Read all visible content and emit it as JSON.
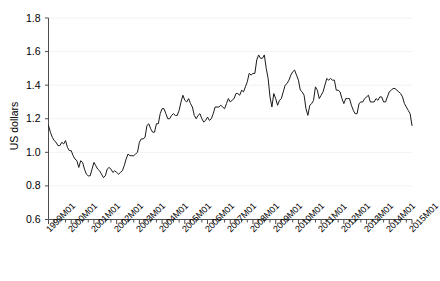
{
  "chart_data": {
    "type": "line",
    "title": "",
    "xlabel": "",
    "ylabel": "US dollars",
    "ylim": [
      0.6,
      1.8
    ],
    "ytick_values": [
      0.6,
      0.8,
      1.0,
      1.2,
      1.4,
      1.6,
      1.8
    ],
    "ytick_labels": [
      "0.6",
      "0.8",
      "1.0",
      "1.2",
      "1.4",
      "1.6",
      "1.8"
    ],
    "grid": true,
    "legend": "none",
    "xtick_labels": [
      "1999M01",
      "2000M01",
      "2001M01",
      "2002M01",
      "2003M01",
      "2004M01",
      "2005M01",
      "2006M01",
      "2007M01",
      "2008M01",
      "2009M01",
      "2010M01",
      "2011M01",
      "2012M01",
      "2013M01",
      "2014M01",
      "2015M01"
    ],
    "x_start": "1999M01",
    "x_end": "2015M01",
    "x_frequency": "monthly",
    "series": [
      {
        "name": "US dollars per euro",
        "color": "#1a1a1a",
        "values": [
          1.16,
          1.12,
          1.09,
          1.07,
          1.06,
          1.04,
          1.04,
          1.06,
          1.05,
          1.07,
          1.03,
          1.01,
          1.01,
          0.98,
          0.96,
          0.95,
          0.91,
          0.95,
          0.94,
          0.9,
          0.87,
          0.86,
          0.86,
          0.9,
          0.94,
          0.92,
          0.9,
          0.89,
          0.87,
          0.85,
          0.86,
          0.9,
          0.91,
          0.9,
          0.88,
          0.89,
          0.88,
          0.87,
          0.88,
          0.89,
          0.92,
          0.96,
          0.99,
          0.98,
          0.98,
          0.98,
          0.99,
          1.0,
          1.06,
          1.08,
          1.08,
          1.09,
          1.16,
          1.17,
          1.14,
          1.12,
          1.12,
          1.17,
          1.17,
          1.23,
          1.26,
          1.26,
          1.23,
          1.2,
          1.2,
          1.22,
          1.23,
          1.22,
          1.22,
          1.25,
          1.3,
          1.34,
          1.31,
          1.3,
          1.32,
          1.29,
          1.27,
          1.22,
          1.2,
          1.22,
          1.23,
          1.2,
          1.18,
          1.19,
          1.21,
          1.19,
          1.2,
          1.23,
          1.27,
          1.27,
          1.27,
          1.28,
          1.27,
          1.26,
          1.29,
          1.32,
          1.3,
          1.31,
          1.32,
          1.35,
          1.35,
          1.34,
          1.37,
          1.36,
          1.39,
          1.42,
          1.47,
          1.46,
          1.47,
          1.47,
          1.55,
          1.58,
          1.56,
          1.56,
          1.58,
          1.5,
          1.44,
          1.33,
          1.27,
          1.35,
          1.32,
          1.28,
          1.31,
          1.32,
          1.36,
          1.4,
          1.41,
          1.43,
          1.46,
          1.48,
          1.49,
          1.46,
          1.43,
          1.37,
          1.36,
          1.34,
          1.26,
          1.22,
          1.28,
          1.29,
          1.31,
          1.39,
          1.37,
          1.32,
          1.34,
          1.36,
          1.4,
          1.44,
          1.43,
          1.44,
          1.43,
          1.43,
          1.37,
          1.37,
          1.36,
          1.32,
          1.29,
          1.32,
          1.32,
          1.32,
          1.28,
          1.25,
          1.23,
          1.23,
          1.29,
          1.3,
          1.3,
          1.32,
          1.33,
          1.34,
          1.3,
          1.3,
          1.3,
          1.32,
          1.31,
          1.33,
          1.33,
          1.3,
          1.3,
          1.33,
          1.36,
          1.37,
          1.38,
          1.38,
          1.37,
          1.36,
          1.35,
          1.33,
          1.29,
          1.27,
          1.25,
          1.23,
          1.16
        ]
      }
    ]
  },
  "axes": {
    "y_axis_name": "y-axis",
    "x_axis_name": "x-axis"
  }
}
